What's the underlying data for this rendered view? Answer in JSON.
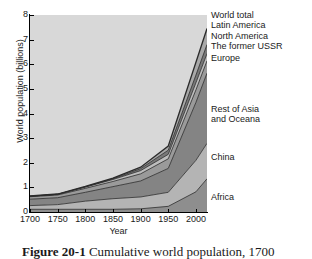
{
  "figure": {
    "caption_label": "Figure 20-1",
    "caption_text": "Cumulative world population, 1700"
  },
  "axes": {
    "ylabel": "World population (billions)",
    "xlabel": "Year",
    "yticks": [
      "0",
      "1",
      "2",
      "3",
      "4",
      "5",
      "6",
      "7",
      "8"
    ],
    "xticks": [
      "1700",
      "1750",
      "1800",
      "1850",
      "1900",
      "1950",
      "2000"
    ]
  },
  "labels": {
    "world_total": "World total",
    "latin_america": "Latin America",
    "north_america": "North America",
    "former_ussr": "The former USSR",
    "europe": "Europe",
    "rest_of_asia_l1": "Rest of Asia",
    "rest_of_asia_l2": "and Oceana",
    "china": "China",
    "africa": "Africa"
  },
  "colors": {
    "plot_background": "#d8d8d8",
    "africa": "#8e8e8e",
    "china": "#b4b4b4",
    "rest_of_asia": "#848484",
    "europe": "#9a9a9a",
    "former_ussr": "#bdbdbd",
    "north_america": "#787878",
    "latin_america": "#a8a8a8",
    "line": "#2b2b2b",
    "axis": "#000000",
    "text": "#1a1a1a"
  },
  "chart_data": {
    "type": "area",
    "title": "",
    "subtitle": "",
    "xlabel": "Year",
    "ylabel": "World population (billions)",
    "xlim": [
      1700,
      2020
    ],
    "ylim": [
      0,
      8
    ],
    "grid": false,
    "stacked": true,
    "legend": "right-side direct labels",
    "annotations": [
      "World total",
      "Latin America",
      "North America",
      "The former USSR",
      "Europe",
      "Rest of Asia and Oceana",
      "China",
      "Africa"
    ],
    "x": [
      1700,
      1750,
      1800,
      1850,
      1900,
      1950,
      2000,
      2020
    ],
    "series": [
      {
        "name": "Africa",
        "values": [
          0.11,
          0.11,
          0.11,
          0.11,
          0.13,
          0.23,
          0.82,
          1.35
        ]
      },
      {
        "name": "China",
        "values": [
          0.15,
          0.19,
          0.33,
          0.43,
          0.48,
          0.57,
          1.28,
          1.44
        ]
      },
      {
        "name": "Rest of Asia and Oceana",
        "values": [
          0.26,
          0.28,
          0.36,
          0.49,
          0.65,
          0.97,
          2.35,
          2.85
        ]
      },
      {
        "name": "Europe",
        "values": [
          0.1,
          0.11,
          0.16,
          0.21,
          0.29,
          0.39,
          0.51,
          0.5
        ]
      },
      {
        "name": "The former USSR",
        "values": [
          0.02,
          0.03,
          0.05,
          0.08,
          0.13,
          0.18,
          0.29,
          0.29
        ]
      },
      {
        "name": "North America",
        "values": [
          0.0,
          0.0,
          0.01,
          0.03,
          0.08,
          0.17,
          0.31,
          0.37
        ]
      },
      {
        "name": "Latin America",
        "values": [
          0.01,
          0.01,
          0.02,
          0.03,
          0.06,
          0.17,
          0.52,
          0.65
        ]
      }
    ],
    "totals": [
      0.65,
      0.73,
      1.04,
      1.38,
      1.82,
      2.68,
      6.08,
      7.45
    ],
    "total_series_name": "World total"
  }
}
